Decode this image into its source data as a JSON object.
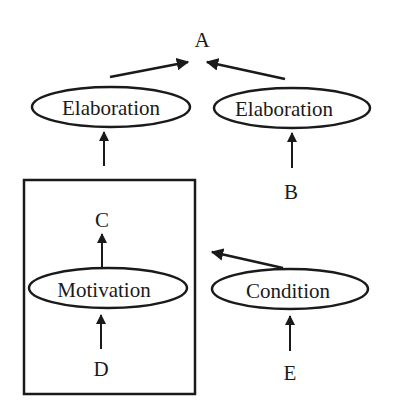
{
  "colors": {
    "ink": "#1a1a1a",
    "background": "#ffffff"
  },
  "nodes": {
    "a": {
      "label": "A"
    },
    "b": {
      "label": "B"
    },
    "c": {
      "label": "C"
    },
    "d": {
      "label": "D"
    },
    "e": {
      "label": "E"
    },
    "elaboration_left": {
      "label": "Elaboration"
    },
    "elaboration_right": {
      "label": "Elaboration"
    },
    "motivation": {
      "label": "Motivation"
    },
    "condition": {
      "label": "Condition"
    }
  },
  "edges": [
    {
      "from": "elaboration_left",
      "to": "a"
    },
    {
      "from": "elaboration_right",
      "to": "a"
    },
    {
      "from": "box",
      "to": "elaboration_left"
    },
    {
      "from": "b",
      "to": "elaboration_right"
    },
    {
      "from": "motivation",
      "to": "c"
    },
    {
      "from": "d",
      "to": "motivation"
    },
    {
      "from": "e",
      "to": "condition"
    },
    {
      "from": "condition",
      "to": "box"
    }
  ],
  "groups": [
    {
      "id": "box",
      "contains": [
        "c",
        "motivation",
        "d"
      ]
    }
  ]
}
